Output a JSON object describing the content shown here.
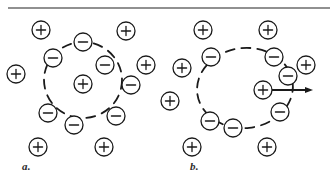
{
  "figure": {
    "background_color": "#ffffff",
    "ink_color": "#1a1a1a",
    "top_rule": {
      "y": 8,
      "x1": 8,
      "x2": 330,
      "color": "#6b6b6b",
      "thickness": 1.4
    },
    "panels": [
      {
        "id": "a",
        "label": "a.",
        "label_position": {
          "x": 22,
          "y": 160
        },
        "description": "Stationary positive charge surrounded by a symmetric ring of negative charges",
        "center_charge": {
          "sign": "+",
          "cx": 83,
          "cy": 84,
          "r": 9
        },
        "screening_boundary": {
          "shape": "circle",
          "cx": 83,
          "cy": 80,
          "rx": 39,
          "ry": 38,
          "style": "dashed",
          "dash": "9 7",
          "thickness": 1.8
        },
        "shell_charges": [
          {
            "sign": "-",
            "cx": 83,
            "cy": 42,
            "r": 9
          },
          {
            "sign": "-",
            "cx": 53,
            "cy": 58,
            "r": 9
          },
          {
            "sign": "-",
            "cx": 105,
            "cy": 65,
            "r": 9
          },
          {
            "sign": "-",
            "cx": 131,
            "cy": 85,
            "r": 9
          },
          {
            "sign": "-",
            "cx": 116,
            "cy": 116,
            "r": 9
          },
          {
            "sign": "-",
            "cx": 74,
            "cy": 125,
            "r": 9
          },
          {
            "sign": "-",
            "cx": 48,
            "cy": 113,
            "r": 9
          }
        ],
        "background_charges": [
          {
            "sign": "+",
            "cx": 41,
            "cy": 30,
            "r": 9
          },
          {
            "sign": "+",
            "cx": 126,
            "cy": 31,
            "r": 9
          },
          {
            "sign": "+",
            "cx": 146,
            "cy": 65,
            "r": 9
          },
          {
            "sign": "+",
            "cx": 16,
            "cy": 74,
            "r": 9
          },
          {
            "sign": "+",
            "cx": 38,
            "cy": 147,
            "r": 9
          },
          {
            "sign": "+",
            "cx": 104,
            "cy": 147,
            "r": 9
          }
        ],
        "velocity_arrow": null
      },
      {
        "id": "b",
        "label": "b.",
        "label_position": {
          "x": 190,
          "y": 160
        },
        "description": "Moving positive charge with an asymmetric, trailing screening cloud and velocity arrow",
        "center_charge": {
          "sign": "+",
          "cx": 263,
          "cy": 90,
          "r": 9
        },
        "screening_boundary": {
          "shape": "ellipse",
          "cx": 245,
          "cy": 88,
          "rx": 48,
          "ry": 40,
          "rotation": -6,
          "style": "dashed",
          "dash": "9 7",
          "thickness": 1.8
        },
        "shell_charges": [
          {
            "sign": "-",
            "cx": 211,
            "cy": 57,
            "r": 9
          },
          {
            "sign": "-",
            "cx": 274,
            "cy": 57,
            "r": 9
          },
          {
            "sign": "-",
            "cx": 288,
            "cy": 76,
            "r": 9
          },
          {
            "sign": "-",
            "cx": 280,
            "cy": 112,
            "r": 9
          },
          {
            "sign": "-",
            "cx": 210,
            "cy": 121,
            "r": 9
          },
          {
            "sign": "-",
            "cx": 233,
            "cy": 128,
            "r": 9
          }
        ],
        "background_charges": [
          {
            "sign": "+",
            "cx": 203,
            "cy": 30,
            "r": 9
          },
          {
            "sign": "+",
            "cx": 268,
            "cy": 30,
            "r": 9
          },
          {
            "sign": "+",
            "cx": 306,
            "cy": 65,
            "r": 9
          },
          {
            "sign": "+",
            "cx": 182,
            "cy": 68,
            "r": 9
          },
          {
            "sign": "+",
            "cx": 170,
            "cy": 101,
            "r": 9
          },
          {
            "sign": "+",
            "cx": 192,
            "cy": 147,
            "r": 9
          },
          {
            "sign": "+",
            "cx": 267,
            "cy": 147,
            "r": 9
          }
        ],
        "velocity_arrow": {
          "x1": 272,
          "y1": 90,
          "x2": 313,
          "y2": 90,
          "head_length": 8,
          "head_width": 6,
          "thickness": 1.8,
          "direction": "right"
        }
      }
    ]
  }
}
